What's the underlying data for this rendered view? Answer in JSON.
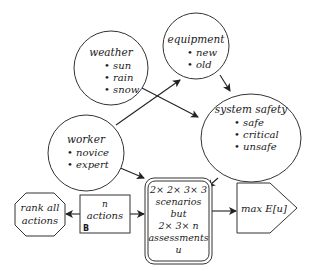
{
  "diagram": {
    "nodes": {
      "weather": {
        "title": "weather",
        "items": [
          "sun",
          "rain",
          "snow"
        ],
        "shape": "chance-circle"
      },
      "equipment": {
        "title": "equipment",
        "items": [
          "new",
          "old"
        ],
        "shape": "chance-circle"
      },
      "system_safety": {
        "title": "system safety",
        "items": [
          "safe",
          "critical",
          "unsafe"
        ],
        "shape": "chance-ellipse"
      },
      "worker": {
        "title": "worker",
        "items": [
          "novice",
          "expert"
        ],
        "shape": "chance-circle"
      },
      "rank": {
        "line1": "rank all",
        "line2": "actions",
        "shape": "octagon"
      },
      "actions": {
        "line1": "n",
        "line2": "actions",
        "badge": "B",
        "shape": "decision-rectangle"
      },
      "scenarios": {
        "lines": [
          "2× 2× 3× 3",
          "scenarios",
          "but",
          "2× 3× n",
          "assessments",
          "u"
        ],
        "shape": "double-rounded-rectangle"
      },
      "utility": {
        "label": "max E[u]",
        "shape": "pentagon"
      }
    },
    "edges": [
      {
        "from": "worker",
        "to": "equipment"
      },
      {
        "from": "weather",
        "to": "system_safety"
      },
      {
        "from": "equipment",
        "to": "system_safety"
      },
      {
        "from": "worker",
        "to": "scenarios"
      },
      {
        "from": "system_safety",
        "to": "scenarios"
      },
      {
        "from": "actions",
        "to": "scenarios"
      },
      {
        "from": "actions",
        "to": "rank"
      },
      {
        "from": "scenarios",
        "to": "utility"
      }
    ],
    "bullet": "•"
  }
}
